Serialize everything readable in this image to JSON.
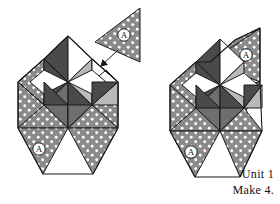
{
  "figure": {
    "kind": "quilt-block-assembly-diagram",
    "caption_line1": "Unit 1",
    "caption_line2": "Make 4.",
    "piece_label": "A",
    "background_color": "#ffffff",
    "ink_color": "#111111"
  },
  "palette": {
    "dotted_fill": "#8a8a8a",
    "dot_color": "#ffffff",
    "dark_gray": "#4a4a4a",
    "mid_gray": "#6e6e6e",
    "light_gray": "#b9b9b9",
    "white": "#ffffff",
    "outline": "#1a1a1a"
  },
  "loose_piece": {
    "name": "triangle-A-loose",
    "label": "A",
    "fabric": "dotted",
    "orientation": "points-left"
  },
  "arrow": {
    "name": "placement-arrow",
    "direction": "down-left",
    "meaning": "attach piece A at this corner"
  },
  "units": [
    {
      "name": "unit-left-incomplete",
      "state": "missing-top-right-A-triangle",
      "corner_labels": [
        "A"
      ]
    },
    {
      "name": "unit-right-complete",
      "state": "complete",
      "corner_labels": [
        "A",
        "A"
      ]
    }
  ]
}
